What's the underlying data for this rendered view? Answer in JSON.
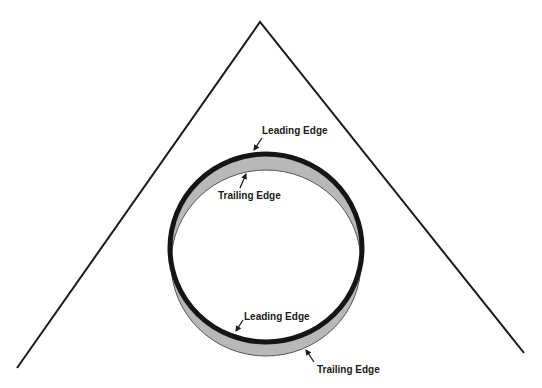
{
  "diagram": {
    "type": "cone-with-ring",
    "colors": {
      "background": "#ffffff",
      "line": "#1a1a1a",
      "leading_edge": "#151515",
      "trailing_band": "#b8b8b8"
    },
    "cone": {
      "apex": [
        260,
        22
      ],
      "left_base": [
        17,
        368
      ],
      "right_base": [
        524,
        353
      ]
    },
    "ring": {
      "center": [
        266,
        248
      ],
      "radius_x": 96,
      "radius_y": 94,
      "trailing_offset_y": 15
    },
    "labels": [
      {
        "id": "leading-edge-top",
        "text": "Leading Edge",
        "x": 262,
        "y": 134,
        "arrow": [
          262,
          138,
          254,
          150
        ]
      },
      {
        "id": "trailing-edge-top",
        "text": "Trailing Edge",
        "x": 218,
        "y": 199,
        "arrow": [
          240,
          188,
          246,
          174
        ]
      },
      {
        "id": "leading-edge-bottom",
        "text": "Leading Edge",
        "x": 244,
        "y": 320,
        "arrow": [
          243,
          320,
          236,
          331
        ]
      },
      {
        "id": "trailing-edge-bottom",
        "text": "Trailing Edge",
        "x": 317,
        "y": 373,
        "arrow": [
          314,
          362,
          306,
          350
        ]
      }
    ]
  }
}
